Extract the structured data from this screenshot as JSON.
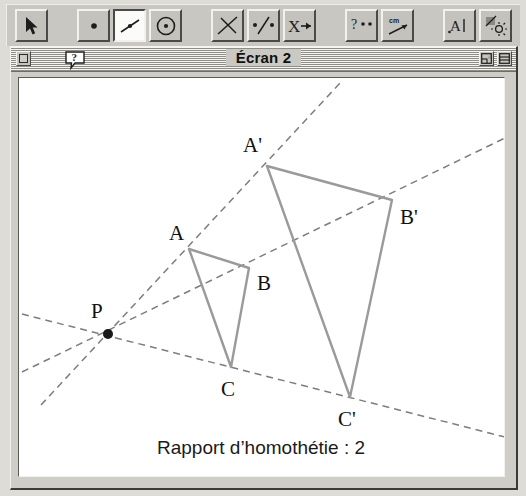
{
  "app": {
    "window_title": "Écran 2"
  },
  "toolbar": {
    "name": "drawing-tools-toolbar",
    "tools": [
      {
        "id": "pointer",
        "icon": "arrow-pointer-icon",
        "label": "Pointeur",
        "selected": false
      },
      {
        "id": "point",
        "icon": "point-icon",
        "label": "Point",
        "selected": false
      },
      {
        "id": "line",
        "icon": "line-segment-icon",
        "label": "Droite",
        "selected": true
      },
      {
        "id": "circle",
        "icon": "circle-icon",
        "label": "Cercle",
        "selected": false
      },
      {
        "id": "perpendicular",
        "icon": "perpendicular-icon",
        "label": "Perpendiculaire",
        "selected": false
      },
      {
        "id": "midpoint",
        "icon": "point-on-line-icon",
        "label": "Point sur droite",
        "selected": false
      },
      {
        "id": "transform",
        "icon": "x-arrow-icon",
        "label": "Transformation",
        "selected": false
      },
      {
        "id": "query",
        "icon": "question-points-icon",
        "label": "Interrogation",
        "selected": false
      },
      {
        "id": "measure",
        "icon": "measure-ruler-icon",
        "label": "Mesure",
        "selected": false
      },
      {
        "id": "text",
        "icon": "text-label-icon",
        "label": "Texte",
        "selected": false
      },
      {
        "id": "appearance",
        "icon": "appearance-icon",
        "label": "Aspect",
        "selected": false
      }
    ]
  },
  "titlebar": {
    "close_button": "close-box",
    "help_button": "help-balloon",
    "zoom_button": "zoom-box",
    "list_button": "list-box"
  },
  "canvas": {
    "caption": "Rapport d’homothétie : 2",
    "center_label": "P",
    "colors": {
      "figure_stroke": "#9a9a9a",
      "ray_stroke": "#7d7d7d",
      "point_fill": "#1a1a1a",
      "background": "#ffffff"
    }
  },
  "chart_data": {
    "type": "diagram",
    "ratio": 2,
    "center": {
      "label": "P",
      "x": 89,
      "y": 256,
      "label_x": 72,
      "label_y": 240
    },
    "points": [
      {
        "label": "A",
        "x": 170,
        "y": 171,
        "label_x": 150,
        "label_y": 162
      },
      {
        "label": "B",
        "x": 230,
        "y": 190,
        "label_x": 238,
        "label_y": 212
      },
      {
        "label": "C",
        "x": 212,
        "y": 289,
        "label_x": 202,
        "label_y": 318
      },
      {
        "label": "A'",
        "x": 248,
        "y": 88,
        "label_x": 224,
        "label_y": 74
      },
      {
        "label": "B'",
        "x": 373,
        "y": 122,
        "label_x": 381,
        "label_y": 146
      },
      {
        "label": "C'",
        "x": 331,
        "y": 319,
        "label_x": 319,
        "label_y": 348
      }
    ],
    "triangles": [
      {
        "name": "ABC",
        "vertices": [
          "A",
          "B",
          "C"
        ]
      },
      {
        "name": "A'B'C'",
        "vertices": [
          "A'",
          "B'",
          "C'"
        ]
      }
    ],
    "rays": [
      {
        "name": "ray-P-A-Aprime",
        "through": [
          "P",
          "A",
          "A'"
        ],
        "x1": 22,
        "y1": 327,
        "x2": 322,
        "y2": 4
      },
      {
        "name": "ray-P-B-Bprime",
        "through": [
          "P",
          "B",
          "B'"
        ],
        "x1": 3,
        "y1": 294,
        "x2": 486,
        "y2": 60
      },
      {
        "name": "ray-P-C-Cprime",
        "through": [
          "P",
          "C",
          "C'"
        ],
        "x1": 3,
        "y1": 236,
        "x2": 486,
        "y2": 359
      }
    ]
  }
}
